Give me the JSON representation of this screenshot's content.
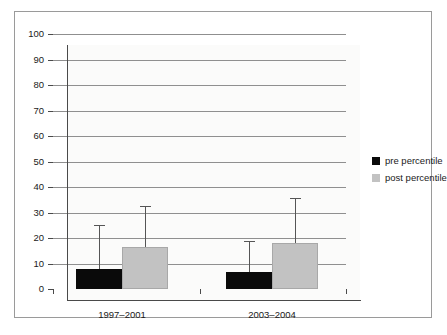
{
  "chart_data": {
    "type": "bar",
    "title": "",
    "subtitle": "",
    "xlabel": "",
    "ylabel": "",
    "categories": [
      "1997–2001",
      "2003–2004"
    ],
    "ylim": [
      0,
      100
    ],
    "yticks": [
      0,
      10,
      20,
      30,
      40,
      50,
      60,
      70,
      80,
      90,
      100
    ],
    "ytick_labels": [
      "0",
      "10",
      "20",
      "30",
      "40",
      "50",
      "60",
      "70",
      "80",
      "90",
      "100"
    ],
    "grid": true,
    "legend_position": "right",
    "series": [
      {
        "name": "pre percentile",
        "color": "#0a0a0a",
        "values": [
          8,
          6.5
        ],
        "error_upper": [
          25,
          19
        ]
      },
      {
        "name": "post percentile",
        "color": "#c2c2c2",
        "values": [
          16.5,
          18
        ],
        "error_upper": [
          32.5,
          35.5
        ]
      }
    ]
  },
  "legend": {
    "items": [
      {
        "label": "pre percentile",
        "color": "#0a0a0a"
      },
      {
        "label": "post percentile",
        "color": "#c2c2c2"
      }
    ]
  },
  "axes": {
    "y_tick_labels": [
      "100",
      "90",
      "80",
      "70",
      "60",
      "50",
      "40",
      "30",
      "20",
      "10",
      "0"
    ],
    "x_tick_labels": [
      "1997–2001",
      "2003–2004"
    ]
  },
  "colors": {
    "pre": "#0a0a0a",
    "post": "#c2c2c2",
    "gridline": "#8f8f8f",
    "axis": "#4a4a4a",
    "frame": "#9a9a9a",
    "plot_background": "#fbfbfa",
    "page_background": "#ffffff",
    "error_bar": "#555555",
    "text": "#1a1a1a"
  }
}
